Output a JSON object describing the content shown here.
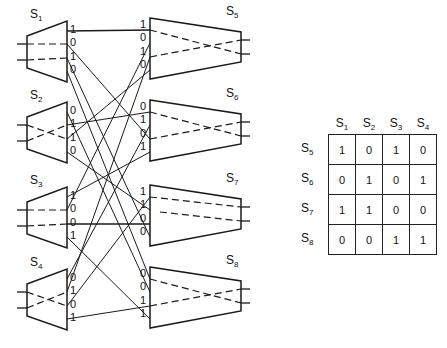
{
  "left_switches": [
    {
      "name": "S",
      "sub": "1",
      "ports": [
        "1",
        "0",
        "1",
        "0"
      ],
      "wiring": "straight"
    },
    {
      "name": "S",
      "sub": "2",
      "ports": [
        "0",
        "1",
        "1",
        "0"
      ],
      "wiring": "cross"
    },
    {
      "name": "S",
      "sub": "3",
      "ports": [
        "1",
        "0",
        "0",
        "1"
      ],
      "wiring": "straight"
    },
    {
      "name": "S",
      "sub": "4",
      "ports": [
        "0",
        "1",
        "0",
        "1"
      ],
      "wiring": "cross"
    }
  ],
  "right_switches": [
    {
      "name": "S",
      "sub": "5",
      "ports": [
        "1",
        "0",
        "1",
        "0"
      ],
      "wiring": "cross"
    },
    {
      "name": "S",
      "sub": "6",
      "ports": [
        "0",
        "1",
        "0",
        "1"
      ],
      "wiring": "cross"
    },
    {
      "name": "S",
      "sub": "7",
      "ports": [
        "1",
        "1",
        "0",
        "0"
      ],
      "wiring": "straight"
    },
    {
      "name": "S",
      "sub": "8",
      "ports": [
        "0",
        "0",
        "1",
        "1"
      ],
      "wiring": "cross"
    }
  ],
  "links": [
    [
      0,
      0,
      0,
      0
    ],
    [
      0,
      1,
      1,
      2
    ],
    [
      0,
      2,
      2,
      3
    ],
    [
      0,
      3,
      3,
      0
    ],
    [
      1,
      0,
      3,
      1
    ],
    [
      1,
      1,
      1,
      0
    ],
    [
      1,
      2,
      0,
      3
    ],
    [
      1,
      3,
      2,
      1
    ],
    [
      2,
      0,
      1,
      3
    ],
    [
      2,
      1,
      0,
      1
    ],
    [
      2,
      2,
      2,
      2
    ],
    [
      2,
      3,
      3,
      3
    ],
    [
      3,
      0,
      1,
      1
    ],
    [
      3,
      1,
      0,
      2
    ],
    [
      3,
      2,
      2,
      0
    ],
    [
      3,
      3,
      3,
      2
    ]
  ],
  "table": {
    "columns": [
      {
        "name": "S",
        "sub": "1"
      },
      {
        "name": "S",
        "sub": "2"
      },
      {
        "name": "S",
        "sub": "3"
      },
      {
        "name": "S",
        "sub": "4"
      }
    ],
    "rows": [
      {
        "name": "S",
        "sub": "5",
        "values": [
          "1",
          "0",
          "1",
          "0"
        ]
      },
      {
        "name": "S",
        "sub": "6",
        "values": [
          "0",
          "1",
          "0",
          "1"
        ]
      },
      {
        "name": "S",
        "sub": "7",
        "values": [
          "1",
          "1",
          "0",
          "0"
        ]
      },
      {
        "name": "S",
        "sub": "8",
        "values": [
          "0",
          "0",
          "1",
          "1"
        ]
      }
    ]
  }
}
